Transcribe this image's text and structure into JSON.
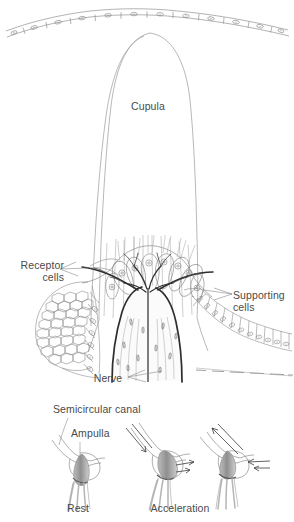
{
  "figure": {
    "background_color": "#ffffff",
    "line_color": "#6e6e6e",
    "dark_line_color": "#2a2a2a",
    "label_color": "#4a4a4a",
    "width": 294,
    "height": 522
  },
  "labels": {
    "cupula": "Cupula",
    "receptor_cells_line1": "Receptor",
    "receptor_cells_line2": "cells",
    "supporting_cells_line1": "Supporting",
    "supporting_cells_line2": "cells",
    "nerve": "Nerve",
    "semicircular_canal": "Semicircular canal",
    "ampulla": "Ampulla",
    "rest": "Rest",
    "acceleration": "Acceleration"
  },
  "panels": {
    "main": {
      "name": "crista-ampullaris-cross-section",
      "structures": [
        "epithelial-cell-row-top",
        "cupula-dome",
        "hair-cell-bundle",
        "receptor-cell-mosaic-left",
        "supporting-cell-epithelium-right",
        "nerve-branch-tree"
      ]
    },
    "inset_rest": {
      "name": "semicircular-canal-rest",
      "caption": "Rest",
      "arrows": []
    },
    "inset_acceleration_1": {
      "name": "semicircular-canal-acceleration-1",
      "caption": "Acceleration",
      "arrows": [
        "endolymph-flow-down-left",
        "cupula-deflect-right"
      ]
    },
    "inset_acceleration_2": {
      "name": "semicircular-canal-acceleration-2",
      "caption": "",
      "arrows": [
        "endolymph-flow-up-right",
        "cupula-deflect-left"
      ]
    }
  }
}
